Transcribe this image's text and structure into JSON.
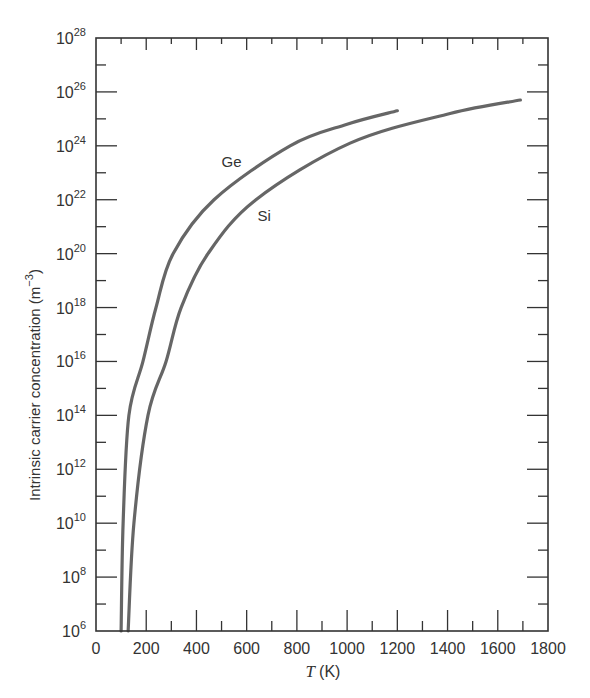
{
  "chart_data": {
    "type": "line",
    "title": "",
    "xlabel": "T (K)",
    "xlabel_var": "T",
    "xlabel_unit": "(K)",
    "ylabel": "Intrinsic carrier concentration (m^-3)",
    "ylabel_text": "Intrinsic carrier concentration (m",
    "ylabel_exp": "−3",
    "ylabel_close": ")",
    "yscale": "log",
    "xlim": [
      0,
      1800
    ],
    "ylim_log10": [
      6,
      28
    ],
    "xticks": [
      0,
      200,
      400,
      600,
      800,
      1000,
      1200,
      1400,
      1600,
      1800
    ],
    "xminor_step": 100,
    "yticks_log10": [
      6,
      8,
      10,
      12,
      14,
      16,
      18,
      20,
      22,
      24,
      26,
      28
    ],
    "yminor_step_log10": 1,
    "grid": false,
    "legend": "inline labels",
    "series": [
      {
        "name": "Ge",
        "color": "#666666",
        "label_pos": {
          "T": 540,
          "log10_n": 23.2
        },
        "points": [
          {
            "T": 100,
            "log10_n": 6
          },
          {
            "T": 108,
            "log10_n": 10
          },
          {
            "T": 131,
            "log10_n": 14
          },
          {
            "T": 187,
            "log10_n": 16
          },
          {
            "T": 239,
            "log10_n": 18
          },
          {
            "T": 307,
            "log10_n": 20
          },
          {
            "T": 470,
            "log10_n": 22
          },
          {
            "T": 773,
            "log10_n": 24
          },
          {
            "T": 1000,
            "log10_n": 24.8
          },
          {
            "T": 1200,
            "log10_n": 25.3
          }
        ]
      },
      {
        "name": "Si",
        "color": "#666666",
        "label_pos": {
          "T": 670,
          "log10_n": 21.2
        },
        "points": [
          {
            "T": 128,
            "log10_n": 6
          },
          {
            "T": 151,
            "log10_n": 10
          },
          {
            "T": 207,
            "log10_n": 14
          },
          {
            "T": 279,
            "log10_n": 16
          },
          {
            "T": 339,
            "log10_n": 18
          },
          {
            "T": 446,
            "log10_n": 20
          },
          {
            "T": 637,
            "log10_n": 22
          },
          {
            "T": 1012,
            "log10_n": 24.1
          },
          {
            "T": 1410,
            "log10_n": 25.2
          },
          {
            "T": 1690,
            "log10_n": 25.7
          }
        ]
      }
    ]
  }
}
